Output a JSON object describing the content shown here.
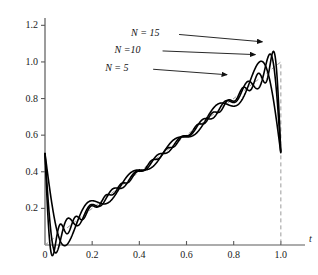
{
  "chart_data": {
    "type": "line",
    "title": "",
    "xlabel": "t",
    "ylabel": "",
    "xlim": [
      0,
      1.06
    ],
    "ylim": [
      0,
      1.24
    ],
    "grid": false,
    "legend_position": "inside-upper-left-annotations",
    "xticks": [
      0,
      0.2,
      0.4,
      0.6,
      0.8,
      1.0
    ],
    "xticklabels": [
      "0",
      "0.2",
      "0.4",
      "0.6",
      "0.8",
      "1.0"
    ],
    "yticks": [
      0.2,
      0.4,
      0.6,
      0.8,
      1.0,
      1.2
    ],
    "yticklabels": [
      "0.2",
      "0.4",
      "0.6",
      "0.8",
      "1.0",
      "1.2"
    ],
    "annotations": [
      {
        "text": "N = 15",
        "x": 0.56,
        "y": 1.15,
        "arrow_to_x": 0.93,
        "arrow_to_y": 1.11
      },
      {
        "text": "N =10",
        "x": 0.49,
        "y": 1.06,
        "arrow_to_x": 0.9,
        "arrow_to_y": 1.04
      },
      {
        "text": "N = 5",
        "x": 0.45,
        "y": 0.96,
        "arrow_to_x": 0.78,
        "arrow_to_y": 0.93
      }
    ],
    "series": [
      {
        "name": "N = 5",
        "harmonics": 5,
        "style": "solid",
        "color": "#000000",
        "width": 1.6
      },
      {
        "name": "N = 10",
        "harmonics": 10,
        "style": "solid",
        "color": "#000000",
        "width": 1.6
      },
      {
        "name": "N = 15",
        "harmonics": 15,
        "style": "solid",
        "color": "#000000",
        "width": 1.6
      },
      {
        "name": "ideal ramp",
        "style": "dashed",
        "color": "#9a9a9a",
        "width": 1.0,
        "points": [
          [
            0,
            0
          ],
          [
            1.0,
            1.0
          ],
          [
            1.0,
            0.0
          ]
        ]
      }
    ]
  },
  "axes": {
    "x_axis_title": "t",
    "spine_color": "#5a5a5a"
  }
}
